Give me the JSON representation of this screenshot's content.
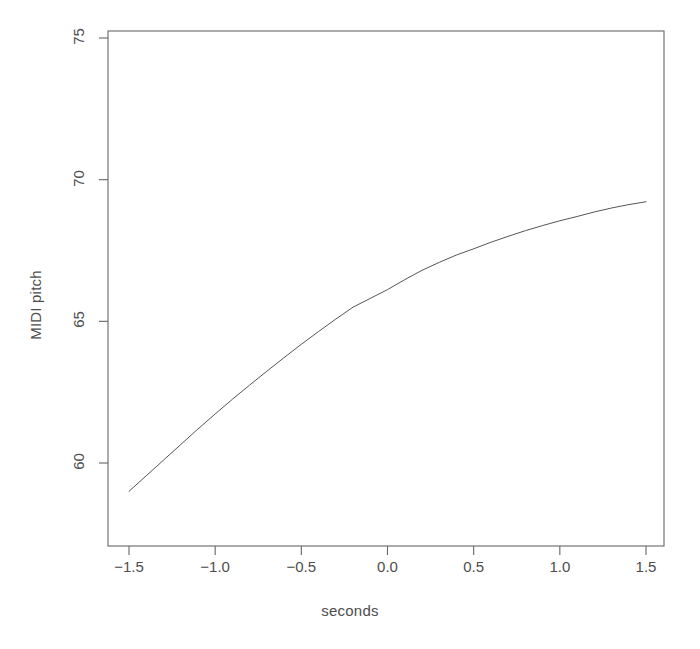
{
  "chart_data": {
    "type": "line",
    "title": "",
    "xlabel": "seconds",
    "ylabel": "MIDI pitch",
    "xlim": [
      -1.62,
      -1.62
    ],
    "x_axis_range": [
      -1.65,
      1.68
    ],
    "y_axis_range": [
      57.3,
      75.9
    ],
    "xticks": [
      -1.5,
      -1.0,
      -0.5,
      0.0,
      0.5,
      1.0,
      1.5
    ],
    "xtick_labels": [
      "-1.5",
      "-1.0",
      "-0.5",
      "0.0",
      "0.5",
      "1.0",
      "1.5"
    ],
    "yticks": [
      60,
      65,
      70,
      75
    ],
    "ytick_labels": [
      "60",
      "65",
      "70",
      "75"
    ],
    "grid": false,
    "legend": null,
    "frame": "box",
    "line_color": "#555555",
    "line_width": 1,
    "series": [
      {
        "name": "pitch contour",
        "x": [
          -1.5,
          -1.4,
          -1.3,
          -1.2,
          -1.1,
          -1.0,
          -0.9,
          -0.8,
          -0.7,
          -0.6,
          -0.5,
          -0.4,
          -0.3,
          -0.2,
          -0.1,
          0.0,
          0.1,
          0.2,
          0.3,
          0.4,
          0.5,
          0.6,
          0.7,
          0.8,
          0.9,
          1.0,
          1.1,
          1.2,
          1.3,
          1.4,
          1.5
        ],
        "y": [
          59.0,
          59.55,
          60.1,
          60.65,
          61.2,
          61.73,
          62.25,
          62.75,
          63.24,
          63.72,
          64.19,
          64.64,
          65.08,
          65.5,
          65.81,
          66.12,
          66.47,
          66.8,
          67.08,
          67.34,
          67.56,
          67.79,
          68.0,
          68.2,
          68.38,
          68.55,
          68.7,
          68.86,
          69.0,
          69.12,
          69.22
        ]
      }
    ],
    "endpoints": {
      "start": {
        "x": -1.5,
        "y": 59.0
      },
      "end": {
        "x": 1.5,
        "y": 69.2
      }
    }
  },
  "plot_geometry": {
    "frame_left": 108,
    "frame_right": 664,
    "frame_top": 31,
    "frame_bottom": 546,
    "x_pixel_at_minus_1_5": 129,
    "x_pixel_at_1_5": 646,
    "y_pixel_at_60": 463,
    "y_pixel_at_75": 38
  },
  "style": {
    "background": "#ffffff",
    "axis_color": "#666666",
    "text_color": "#4d4d4d"
  }
}
